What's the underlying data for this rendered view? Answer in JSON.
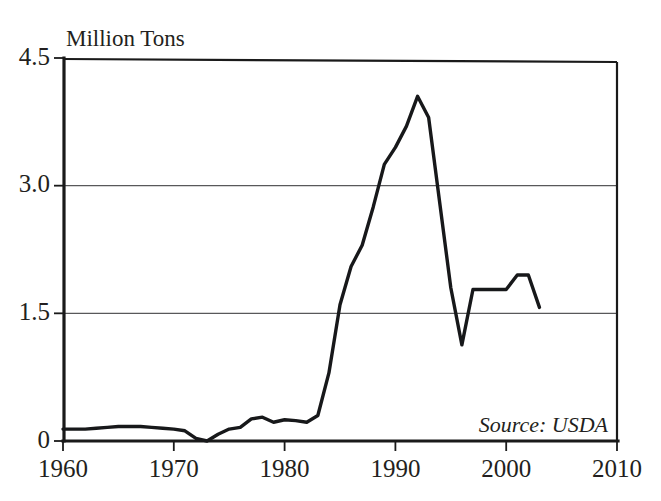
{
  "chart_data": {
    "type": "line",
    "title": "",
    "ylabel": "Million Tons",
    "xlabel": "",
    "xlim": [
      1960,
      2010
    ],
    "ylim": [
      0,
      4.5
    ],
    "grid": "horizontal",
    "legend": "none",
    "y_ticks": [
      "0",
      "1.5",
      "3.0",
      "4.5"
    ],
    "y_tick_values": [
      0,
      1.5,
      3.0,
      4.5
    ],
    "x_ticks": [
      "1960",
      "1970",
      "1980",
      "1990",
      "2000",
      "2010"
    ],
    "x_tick_values": [
      1960,
      1970,
      1980,
      1990,
      2000,
      2010
    ],
    "annotation": "Source: USDA",
    "line_color": "#17181a",
    "grid_color": "#58585a",
    "axis_color": "#1a1a1a",
    "series": [
      {
        "name": "Production",
        "x": [
          1960,
          1961,
          1962,
          1963,
          1964,
          1965,
          1966,
          1967,
          1968,
          1969,
          1970,
          1971,
          1972,
          1973,
          1974,
          1975,
          1976,
          1977,
          1978,
          1979,
          1980,
          1981,
          1982,
          1983,
          1984,
          1985,
          1986,
          1987,
          1988,
          1989,
          1990,
          1991,
          1992,
          1993,
          1994,
          1995,
          1996,
          1997,
          1998,
          1999,
          2000,
          2001,
          2002,
          2003
        ],
        "values": [
          0.14,
          0.14,
          0.14,
          0.15,
          0.16,
          0.17,
          0.17,
          0.17,
          0.16,
          0.15,
          0.14,
          0.12,
          0.03,
          0.0,
          0.08,
          0.14,
          0.16,
          0.26,
          0.28,
          0.22,
          0.25,
          0.24,
          0.22,
          0.3,
          0.8,
          1.6,
          2.05,
          2.3,
          2.75,
          3.25,
          3.45,
          3.7,
          4.05,
          3.8,
          2.8,
          1.8,
          1.13,
          1.78,
          1.78,
          1.78,
          1.78,
          1.95,
          1.95,
          1.57
        ]
      }
    ]
  }
}
